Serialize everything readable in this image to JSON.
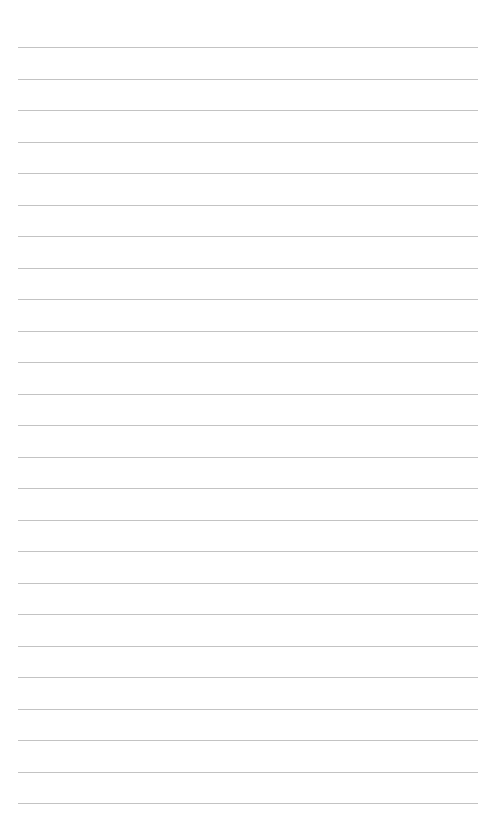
{
  "page": {
    "type": "lined-paper",
    "background_color": "#ffffff",
    "line_color": "#b9b9b9",
    "line_count": 25,
    "first_line_y": 47,
    "line_spacing": 31.5,
    "line_left": 18,
    "line_right": 478,
    "text": ""
  }
}
